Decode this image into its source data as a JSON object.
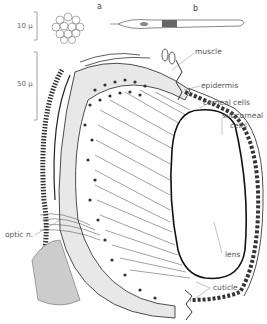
{
  "figure": {
    "panels": [
      {
        "letter": "a",
        "description": "cornea cells surface view (hexagonal)"
      },
      {
        "letter": "b",
        "description": "isolated elongated retinal cell"
      }
    ],
    "scale_bars": [
      {
        "label": "10 µ"
      },
      {
        "label": "50 µ"
      }
    ],
    "labels": {
      "muscle": "muscle",
      "epidermis": "epidermis",
      "corneal_cells": "corneal cells",
      "subcorneal_1": "subcorneal",
      "subcorneal_2": "cells",
      "optic_n": "optic n.",
      "lens": "lens",
      "cuticle": "cuticle"
    },
    "colors": {
      "ink": "#222222",
      "label": "#555555",
      "background": "#ffffff"
    }
  }
}
